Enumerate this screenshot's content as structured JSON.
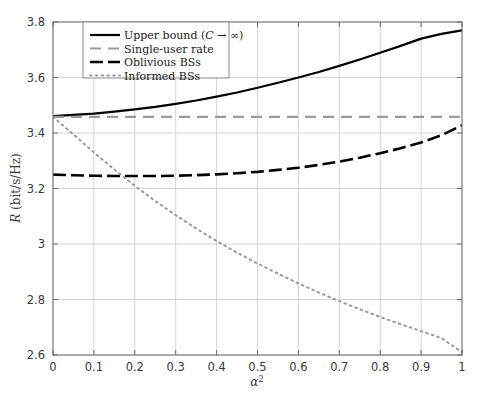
{
  "chart_data": {
    "type": "line",
    "title": "",
    "xlabel": "α²",
    "ylabel": "R (bit/s/Hz)",
    "xlim": [
      0,
      1
    ],
    "ylim": [
      2.6,
      3.8
    ],
    "xticks": [
      "0",
      "0.1",
      "0.2",
      "0.3",
      "0.4",
      "0.5",
      "0.6",
      "0.7",
      "0.8",
      "0.9",
      "1"
    ],
    "xtick_values": [
      0,
      0.1,
      0.2,
      0.3,
      0.4,
      0.5,
      0.6,
      0.7,
      0.8,
      0.9,
      1
    ],
    "yticks": [
      "2.6",
      "2.8",
      "3",
      "3.2",
      "3.4",
      "3.6",
      "3.8"
    ],
    "ytick_values": [
      2.6,
      2.8,
      3.0,
      3.2,
      3.4,
      3.6,
      3.8
    ],
    "grid": true,
    "legend_position": "top-left",
    "x": [
      0,
      0.05,
      0.1,
      0.15,
      0.2,
      0.25,
      0.3,
      0.35,
      0.4,
      0.45,
      0.5,
      0.55,
      0.6,
      0.65,
      0.7,
      0.75,
      0.8,
      0.85,
      0.9,
      0.95,
      1
    ],
    "series": [
      {
        "name": "Upper bound (C → ∞)",
        "style": "solid",
        "color": "#000000",
        "width": 2.2,
        "values": [
          3.461,
          3.465,
          3.47,
          3.477,
          3.485,
          3.494,
          3.505,
          3.517,
          3.531,
          3.546,
          3.563,
          3.581,
          3.6,
          3.62,
          3.642,
          3.665,
          3.689,
          3.714,
          3.74,
          3.757,
          3.77
        ]
      },
      {
        "name": "Single-user rate",
        "style": "dashed",
        "color": "#9a9a9a",
        "width": 2.2,
        "values": [
          3.458,
          3.458,
          3.458,
          3.458,
          3.458,
          3.458,
          3.458,
          3.458,
          3.458,
          3.458,
          3.458,
          3.458,
          3.458,
          3.458,
          3.458,
          3.458,
          3.458,
          3.458,
          3.458,
          3.458,
          3.458
        ]
      },
      {
        "name": "Oblivious BSs",
        "style": "dashdot",
        "color": "#000000",
        "width": 2.6,
        "values": [
          3.25,
          3.248,
          3.246,
          3.245,
          3.245,
          3.245,
          3.246,
          3.248,
          3.251,
          3.255,
          3.26,
          3.267,
          3.275,
          3.285,
          3.297,
          3.311,
          3.327,
          3.345,
          3.366,
          3.392,
          3.428
        ]
      },
      {
        "name": "Informed BSs",
        "style": "dotted",
        "color": "#9a9a9a",
        "width": 2.0,
        "values": [
          3.458,
          3.395,
          3.33,
          3.268,
          3.21,
          3.155,
          3.104,
          3.056,
          3.011,
          2.969,
          2.93,
          2.893,
          2.858,
          2.825,
          2.794,
          2.765,
          2.737,
          2.711,
          2.686,
          2.661,
          2.61
        ]
      }
    ]
  },
  "legend": {
    "items": [
      {
        "label": "Upper bound (C → ∞)",
        "style": "solid"
      },
      {
        "label": "Single-user rate",
        "style": "dashed"
      },
      {
        "label": "Oblivious BSs",
        "style": "dashdot"
      },
      {
        "label": "Informed BSs",
        "style": "dotted"
      }
    ]
  },
  "axes": {
    "y_label": "R (bit/s/Hz)",
    "x_label": "α²"
  },
  "colors": {
    "axis": "#6b6b6b",
    "grid": "#d6d6d6",
    "series_dark": "#000000",
    "series_gray": "#9a9a9a",
    "text": "#3a3a3a",
    "background": "#ffffff"
  }
}
